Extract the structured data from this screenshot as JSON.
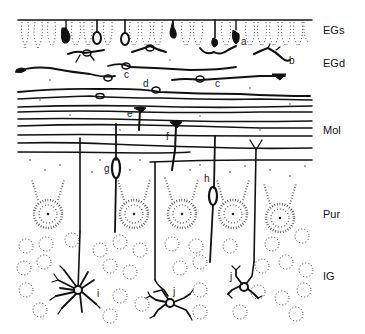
{
  "figure": {
    "layers": [
      {
        "id": "EGs",
        "label": "EGs",
        "y": 31
      },
      {
        "id": "EGd",
        "label": "EGd",
        "y": 63
      },
      {
        "id": "Mol",
        "label": "Mol",
        "y": 130
      },
      {
        "id": "Pur",
        "label": "Pur",
        "y": 214
      },
      {
        "id": "IG",
        "label": "IG",
        "y": 276
      }
    ],
    "cell_labels": [
      {
        "letter": "a",
        "x": 241,
        "y": 45
      },
      {
        "letter": "b",
        "x": 289,
        "y": 64
      },
      {
        "letter": "c",
        "x": 124,
        "y": 78
      },
      {
        "letter": "d",
        "x": 143,
        "y": 87
      },
      {
        "letter": "c",
        "x": 215,
        "y": 87
      },
      {
        "letter": "e",
        "x": 127,
        "y": 117
      },
      {
        "letter": "f",
        "x": 166,
        "y": 140
      },
      {
        "letter": "g",
        "x": 104,
        "y": 172
      },
      {
        "letter": "h",
        "x": 204,
        "y": 182
      },
      {
        "letter": "i",
        "x": 97,
        "y": 297
      },
      {
        "letter": "j",
        "x": 173,
        "y": 295
      },
      {
        "letter": "j",
        "x": 230,
        "y": 280
      }
    ],
    "colors": {
      "ink": "#111111",
      "background": "#ffffff"
    }
  }
}
